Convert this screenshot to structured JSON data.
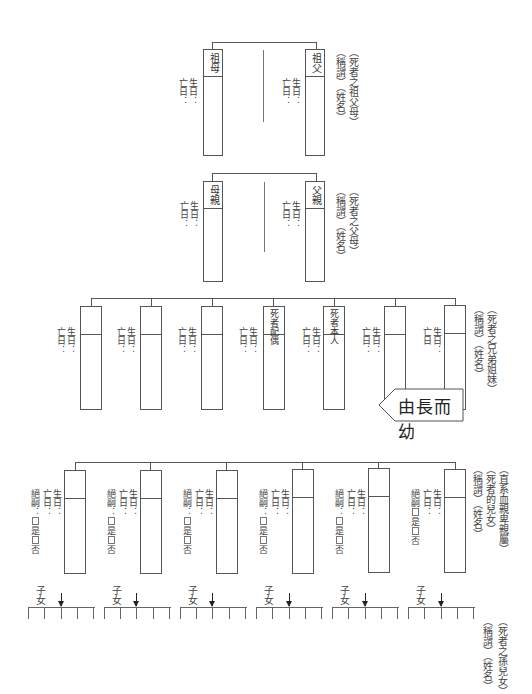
{
  "grandparents": {
    "caption_line1": "（死者之祖父母）",
    "caption_line2": "（稱謂）（姓名）",
    "left": {
      "title": "祖母",
      "birth": "生日：",
      "death": "亡日："
    },
    "right": {
      "title": "祖父",
      "birth": "生日：",
      "death": "亡日："
    }
  },
  "parents": {
    "caption_line1": "（死者之父母）",
    "caption_line2": "（稱謂）（姓名）",
    "left": {
      "title": "母親",
      "birth": "生日：",
      "death": "亡日："
    },
    "right": {
      "title": "父親",
      "birth": "生日：",
      "death": "亡日："
    }
  },
  "siblings": {
    "caption_line1": "（死者之兄弟姐妹）",
    "caption_line2": "（稱謂）（姓名）",
    "members": [
      {
        "title": "",
        "birth": "生日：",
        "death": "亡日："
      },
      {
        "title": "",
        "birth": "生日：",
        "death": "亡日："
      },
      {
        "title": "",
        "birth": "生日：",
        "death": "亡日："
      },
      {
        "title": "死者配偶",
        "birth": "生日：",
        "death": "亡日："
      },
      {
        "title": "死者本人",
        "birth": "生日：",
        "death": "亡日："
      },
      {
        "title": "",
        "birth": "生日：",
        "death": "亡日："
      },
      {
        "title": "",
        "birth": "生日：",
        "death": "亡日"
      }
    ]
  },
  "order_banner": {
    "label": "由長而幼"
  },
  "children": {
    "caption_line1": "（直系血親卑親屬）",
    "caption_line2": "（死者的兒女）",
    "caption_line3": "（稱謂）（姓名）",
    "members": [
      {
        "birth": "生日：",
        "death": "亡日：",
        "heir_label": "絕嗣：",
        "yes": "是",
        "no": "否"
      },
      {
        "birth": "生日：",
        "death": "亡日：",
        "heir_label": "絕嗣：",
        "yes": "是",
        "no": "否"
      },
      {
        "birth": "生日：",
        "death": "亡日：",
        "heir_label": "絕嗣：",
        "yes": "是",
        "no": "否"
      },
      {
        "birth": "生日：",
        "death": "亡日：",
        "heir_label": "絕嗣：",
        "yes": "是",
        "no": "否"
      },
      {
        "birth": "生日：",
        "death": "亡日：",
        "heir_label": "絕嗣：",
        "yes": "是",
        "no": "否"
      },
      {
        "birth": "生日：",
        "death": "亡日：",
        "heir_label": "絕嗣",
        "yes": "是",
        "no": "否"
      }
    ]
  },
  "grandchildren": {
    "caption_line1": "（死者之孫兒女）",
    "caption_line2": "（稱謂）（姓名）",
    "group_label": "子女",
    "groups": 6
  }
}
